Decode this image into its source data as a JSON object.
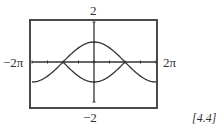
{
  "chart_data": {
    "type": "line",
    "title": "",
    "xlabel": "",
    "ylabel": "",
    "xlim": [
      -6.2832,
      6.2832
    ],
    "ylim": [
      -2,
      2
    ],
    "x_tick_spacing": "pi/2",
    "y_tick_spacing": 1,
    "grid": false,
    "legend": null,
    "window_labels": {
      "ymax": "2",
      "ymin": "−2",
      "xmin": "−2π",
      "xmax": "2π"
    },
    "series": [
      {
        "name": "y = cos(x/2)",
        "domain": [
          -6.2832,
          6.2832
        ],
        "x": [
          -6.2832,
          -4.7124,
          -3.1416,
          -1.5708,
          0,
          1.5708,
          3.1416,
          4.7124,
          6.2832
        ],
        "values": [
          -1,
          -0.707,
          0,
          0.707,
          1,
          0.707,
          0,
          -0.707,
          -1
        ]
      },
      {
        "name": "y = -cos(x/2)",
        "domain": [
          -3.1416,
          3.1416
        ],
        "x": [
          -3.1416,
          -1.5708,
          0,
          1.5708,
          3.1416
        ],
        "values": [
          0,
          -0.707,
          -1,
          -0.707,
          0
        ]
      }
    ],
    "annotations": [
      "intersections at x = −π and x = π on the x-axis"
    ]
  },
  "labels": {
    "ymax": "2",
    "ymin": "−2",
    "xmin": "−2π",
    "xmax": "2π",
    "reference": "[4.4]"
  },
  "colors": {
    "curve": "#333333",
    "axis": "#333333",
    "frame": "#4a4a4a"
  }
}
